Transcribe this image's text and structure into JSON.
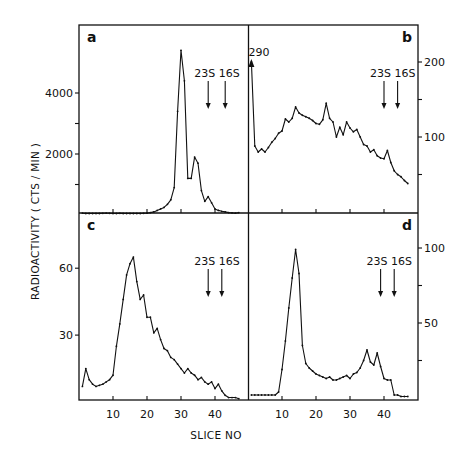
{
  "figure": {
    "ylabel": "RADIOACTIVITY  ( CTS / MIN )",
    "xlabel": "SLICE NO"
  },
  "chart_data": [
    {
      "panel": "a",
      "type": "line",
      "title": "a",
      "xlabel": "SLICE NO",
      "ylabel": "RADIOACTIVITY (CTS/MIN)",
      "y_axis_side": "left",
      "yticks": [
        2000,
        4000
      ],
      "ytick_minor": [
        1000,
        3000
      ],
      "ylim": [
        0,
        5900
      ],
      "xlim": [
        0,
        49
      ],
      "xticks": [
        10,
        20,
        30,
        40
      ],
      "markers": [
        {
          "label": "23S",
          "x": 38
        },
        {
          "label": "16S",
          "x": 43
        }
      ],
      "x": [
        1,
        2,
        3,
        4,
        5,
        6,
        7,
        8,
        9,
        10,
        11,
        12,
        13,
        14,
        15,
        16,
        17,
        18,
        19,
        20,
        21,
        22,
        23,
        24,
        25,
        26,
        27,
        28,
        29,
        30,
        31,
        32,
        33,
        34,
        35,
        36,
        37,
        38,
        39,
        40,
        41,
        42,
        43,
        44,
        45,
        46,
        47
      ],
      "values": [
        60,
        50,
        50,
        50,
        50,
        50,
        55,
        60,
        55,
        50,
        50,
        55,
        50,
        50,
        50,
        50,
        50,
        50,
        55,
        60,
        80,
        100,
        150,
        200,
        250,
        350,
        500,
        900,
        3400,
        5400,
        4400,
        1200,
        1200,
        1900,
        1700,
        800,
        450,
        600,
        400,
        200,
        150,
        120,
        100,
        80,
        70,
        60,
        80
      ]
    },
    {
      "panel": "b",
      "type": "line",
      "title": "b",
      "xlabel": "SLICE NO",
      "ylabel": "RADIOACTIVITY (CTS/MIN)",
      "y_axis_side": "right",
      "yticks": [
        100,
        200
      ],
      "ytick_minor": [
        50,
        150
      ],
      "ylim": [
        0,
        250
      ],
      "xlim": [
        0,
        49
      ],
      "xticks": [
        10,
        20,
        30,
        40
      ],
      "markers": [
        {
          "label": "23S",
          "x": 40
        },
        {
          "label": "16S",
          "x": 44
        }
      ],
      "annotation": {
        "text": "290",
        "x": 1,
        "note": "off-scale first point, arrow pointing up"
      },
      "x": [
        1,
        2,
        3,
        4,
        5,
        6,
        7,
        8,
        9,
        10,
        11,
        12,
        13,
        14,
        15,
        16,
        17,
        18,
        19,
        20,
        21,
        22,
        23,
        24,
        25,
        26,
        27,
        28,
        29,
        30,
        31,
        32,
        33,
        34,
        35,
        36,
        37,
        38,
        39,
        40,
        41,
        42,
        43,
        44,
        45,
        46,
        47
      ],
      "values": [
        200,
        88,
        80,
        84,
        80,
        86,
        93,
        98,
        105,
        108,
        124,
        120,
        125,
        140,
        132,
        129,
        127,
        125,
        122,
        118,
        117,
        123,
        145,
        125,
        120,
        100,
        113,
        103,
        120,
        112,
        107,
        110,
        100,
        90,
        88,
        80,
        83,
        75,
        72,
        71,
        82,
        66,
        55,
        50,
        47,
        42,
        38
      ]
    },
    {
      "panel": "c",
      "type": "line",
      "title": "c",
      "xlabel": "SLICE NO",
      "ylabel": "RADIOACTIVITY (CTS/MIN)",
      "y_axis_side": "left",
      "yticks": [
        30,
        60
      ],
      "ylim": [
        0,
        84
      ],
      "xlim": [
        0,
        49
      ],
      "xticks": [
        10,
        20,
        30,
        40
      ],
      "markers": [
        {
          "label": "23S",
          "x": 38
        },
        {
          "label": "16S",
          "x": 42
        }
      ],
      "x": [
        1,
        2,
        3,
        4,
        5,
        6,
        7,
        8,
        9,
        10,
        11,
        12,
        13,
        14,
        15,
        16,
        17,
        18,
        19,
        20,
        21,
        22,
        23,
        24,
        25,
        26,
        27,
        28,
        29,
        30,
        31,
        32,
        33,
        34,
        35,
        36,
        37,
        38,
        39,
        40,
        41,
        42,
        43,
        44,
        45,
        46,
        47
      ],
      "values": [
        7,
        15,
        10,
        8,
        7,
        7.5,
        8,
        9,
        10,
        12,
        25,
        35,
        46,
        57,
        62,
        65,
        54,
        46,
        48,
        38,
        38,
        31,
        33,
        28,
        24,
        23,
        20,
        19,
        17,
        15,
        13,
        15,
        13,
        12,
        10,
        11,
        9,
        8,
        9,
        6,
        8,
        5,
        3,
        2,
        2,
        2,
        1.5
      ]
    },
    {
      "panel": "d",
      "type": "line",
      "title": "d",
      "xlabel": "SLICE NO",
      "ylabel": "RADIOACTIVITY (CTS/MIN)",
      "y_axis_side": "right",
      "yticks": [
        50,
        100
      ],
      "ytick_minor": [
        25,
        75
      ],
      "ylim": [
        0,
        120
      ],
      "xlim": [
        0,
        49
      ],
      "xticks": [
        10,
        20,
        30,
        40
      ],
      "markers": [
        {
          "label": "23S",
          "x": 39
        },
        {
          "label": "16S",
          "x": 43
        }
      ],
      "x": [
        1,
        2,
        3,
        4,
        5,
        6,
        7,
        8,
        9,
        10,
        11,
        12,
        13,
        14,
        15,
        16,
        17,
        18,
        19,
        20,
        21,
        22,
        23,
        24,
        25,
        26,
        27,
        28,
        29,
        30,
        31,
        32,
        33,
        34,
        35,
        36,
        37,
        38,
        39,
        40,
        41,
        42,
        43,
        44,
        45,
        46,
        47
      ],
      "values": [
        2,
        2,
        2,
        2,
        2,
        2,
        2,
        2,
        4,
        19,
        38,
        60,
        80,
        99,
        83,
        35,
        23,
        20,
        18,
        16,
        15,
        14,
        13,
        14,
        12,
        12,
        13,
        14,
        15,
        13,
        16,
        17,
        20,
        25,
        32,
        24,
        22,
        30,
        21,
        13,
        12,
        12,
        2,
        2,
        1,
        1,
        1
      ]
    }
  ]
}
